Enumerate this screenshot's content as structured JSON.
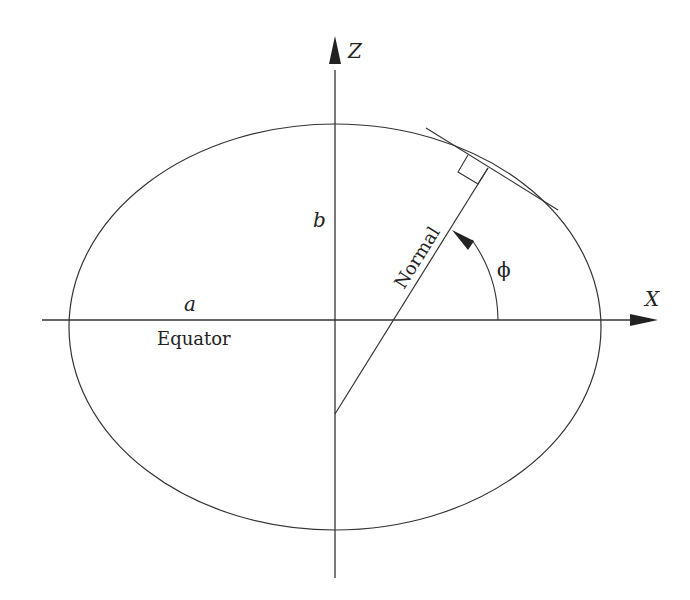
{
  "diagram": {
    "axes": {
      "x_label": "X",
      "z_label": "Z"
    },
    "labels": {
      "semi_major": "a",
      "semi_minor": "b",
      "equator": "Equator",
      "normal": "Normal",
      "latitude_angle": "ϕ"
    },
    "colors": {
      "line": "#333333",
      "background": "#ffffff"
    }
  }
}
